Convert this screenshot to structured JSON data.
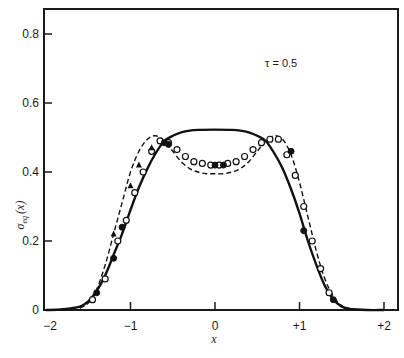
{
  "chart_data": {
    "type": "line",
    "title": "",
    "xlabel": "x",
    "ylabel": "σ_eq (x)",
    "ylabel_main": "σ",
    "ylabel_sub": "eq",
    "ylabel_arg": "(x)",
    "xlim": [
      -2,
      2.15
    ],
    "ylim": [
      0,
      0.87
    ],
    "grid": false,
    "x_ticks": [
      -2,
      -1,
      0,
      1,
      2
    ],
    "x_tick_labels": [
      "−2",
      "−1",
      "0",
      "+1",
      "+2"
    ],
    "y_ticks": [
      0,
      0.2,
      0.4,
      0.6,
      0.8
    ],
    "y_tick_labels": [
      "0",
      "0.2",
      "0.4",
      "0.6",
      "0.8"
    ],
    "annotation": "τ = 0.5",
    "series": [
      {
        "name": "solid curve",
        "style": "solid",
        "x": [
          -2.0,
          -1.8,
          -1.6,
          -1.5,
          -1.4,
          -1.3,
          -1.2,
          -1.1,
          -1.0,
          -0.9,
          -0.8,
          -0.7,
          -0.6,
          -0.5,
          -0.4,
          -0.3,
          -0.2,
          0.0,
          0.2,
          0.3,
          0.4,
          0.5,
          0.6,
          0.7,
          0.8,
          0.9,
          1.0,
          1.1,
          1.2,
          1.3,
          1.4,
          1.5,
          1.6,
          1.8,
          2.0
        ],
        "y": [
          0.0,
          0.002,
          0.01,
          0.025,
          0.055,
          0.1,
          0.16,
          0.22,
          0.29,
          0.355,
          0.41,
          0.455,
          0.49,
          0.505,
          0.515,
          0.52,
          0.522,
          0.523,
          0.522,
          0.52,
          0.515,
          0.505,
          0.49,
          0.455,
          0.41,
          0.35,
          0.28,
          0.2,
          0.13,
          0.07,
          0.03,
          0.01,
          0.003,
          0.0,
          0.0
        ]
      },
      {
        "name": "dashed curve",
        "style": "dashed",
        "x": [
          -1.6,
          -1.5,
          -1.4,
          -1.3,
          -1.2,
          -1.1,
          -1.0,
          -0.9,
          -0.8,
          -0.7,
          -0.6,
          -0.5,
          -0.4,
          -0.3,
          -0.2,
          -0.1,
          0.0,
          0.1,
          0.2,
          0.3,
          0.4,
          0.5,
          0.6,
          0.7,
          0.8,
          0.9,
          1.0,
          1.1,
          1.2,
          1.3,
          1.4,
          1.5,
          1.6
        ],
        "y": [
          0.005,
          0.02,
          0.06,
          0.13,
          0.22,
          0.31,
          0.4,
          0.46,
          0.495,
          0.505,
          0.49,
          0.46,
          0.43,
          0.41,
          0.4,
          0.395,
          0.395,
          0.395,
          0.4,
          0.41,
          0.43,
          0.46,
          0.49,
          0.505,
          0.495,
          0.45,
          0.37,
          0.27,
          0.17,
          0.09,
          0.04,
          0.012,
          0.003
        ]
      },
      {
        "name": "open circles",
        "style": "markers-open",
        "x": [
          -1.45,
          -1.3,
          -1.15,
          -1.05,
          -0.95,
          -0.85,
          -0.75,
          -0.65,
          -0.55,
          -0.45,
          -0.35,
          -0.25,
          -0.15,
          -0.05,
          0.05,
          0.15,
          0.25,
          0.35,
          0.45,
          0.55,
          0.65,
          0.75,
          0.85,
          0.95,
          1.05,
          1.15,
          1.25,
          1.35
        ],
        "y": [
          0.03,
          0.09,
          0.2,
          0.26,
          0.34,
          0.4,
          0.46,
          0.49,
          0.485,
          0.465,
          0.445,
          0.43,
          0.425,
          0.42,
          0.42,
          0.425,
          0.43,
          0.445,
          0.465,
          0.485,
          0.495,
          0.495,
          0.45,
          0.39,
          0.3,
          0.2,
          0.12,
          0.05
        ]
      },
      {
        "name": "filled circles",
        "style": "markers-filled",
        "x": [
          -1.4,
          -1.2,
          -1.1,
          -0.6,
          -0.55,
          0.0,
          0.1,
          0.9,
          1.05,
          1.4
        ],
        "y": [
          0.05,
          0.15,
          0.24,
          0.485,
          0.48,
          0.42,
          0.42,
          0.46,
          0.23,
          0.03
        ]
      },
      {
        "name": "triangles",
        "style": "markers-triangle",
        "x": [
          -1.2,
          -1.0,
          -0.9,
          -0.75
        ],
        "y": [
          0.22,
          0.36,
          0.42,
          0.47
        ]
      }
    ]
  }
}
